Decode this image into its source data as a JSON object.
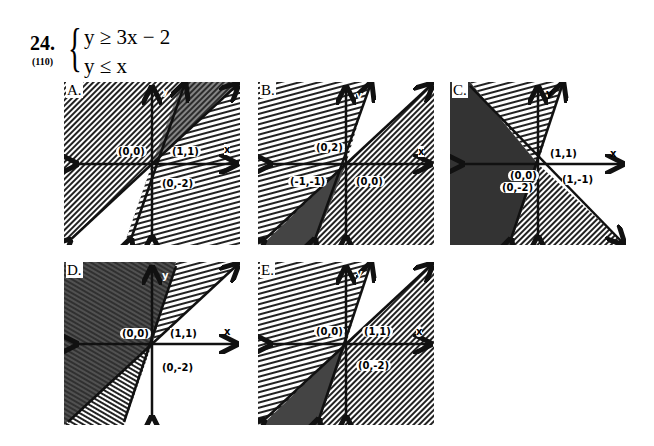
{
  "question": {
    "number": "24.",
    "reference": "(110)",
    "inequalities": [
      "y ≥ 3x − 2",
      "y ≤ x"
    ]
  },
  "options": [
    {
      "label": "A.",
      "points": [
        "(0,0)",
        "(1,1)",
        "(0,-2)"
      ],
      "axes": {
        "x": "x",
        "y": "y"
      }
    },
    {
      "label": "B.",
      "points": [
        "(0,2)",
        "(-1,-1)",
        "(0,0)"
      ],
      "axes": {
        "x": "x",
        "y": "y"
      }
    },
    {
      "label": "C.",
      "points": [
        "(1,1)",
        "(0,0)",
        "(0,-2)",
        "(1,-1)"
      ],
      "axes": {
        "x": "x",
        "y": "y"
      }
    },
    {
      "label": "D.",
      "points": [
        "(0,0)",
        "(1,1)",
        "(0,-2)"
      ],
      "axes": {
        "x": "x",
        "y": "y"
      }
    },
    {
      "label": "E.",
      "points": [
        "(0,0)",
        "(1,1)",
        "(0,-2)"
      ],
      "axes": {
        "x": "x",
        "y": "y"
      }
    }
  ]
}
